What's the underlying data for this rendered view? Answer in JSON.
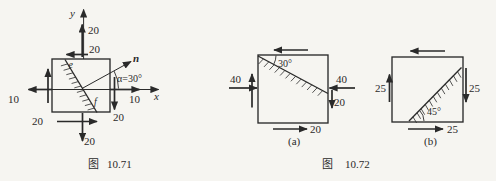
{
  "page": {
    "background_color": "#f6f5f1",
    "line_color": "#2a2a2a"
  },
  "fig1071": {
    "caption_prefix": "图",
    "caption_number": "10.71",
    "axis_y_label": "y",
    "axis_x_label": "x",
    "normal_label": "n",
    "alpha_label": "α=30°",
    "point_e": "e",
    "point_f": "f",
    "sigma_y_top": "20",
    "shear_top": "20",
    "sigma_x_left": "10",
    "sigma_x_right": "10",
    "shear_bottom": "20",
    "shear_right": "20",
    "sigma_y_bottom": "20"
  },
  "fig1072": {
    "caption_prefix": "图",
    "caption_number": "10.72",
    "a": {
      "label": "(a)",
      "angle_label": "30°",
      "sigma_left": "40",
      "sigma_right": "40",
      "shear_right": "20",
      "shear_bottom": "20"
    },
    "b": {
      "label": "(b)",
      "angle_label": "45°",
      "shear_left": "25",
      "shear_right": "25",
      "shear_bottom": "25"
    }
  }
}
